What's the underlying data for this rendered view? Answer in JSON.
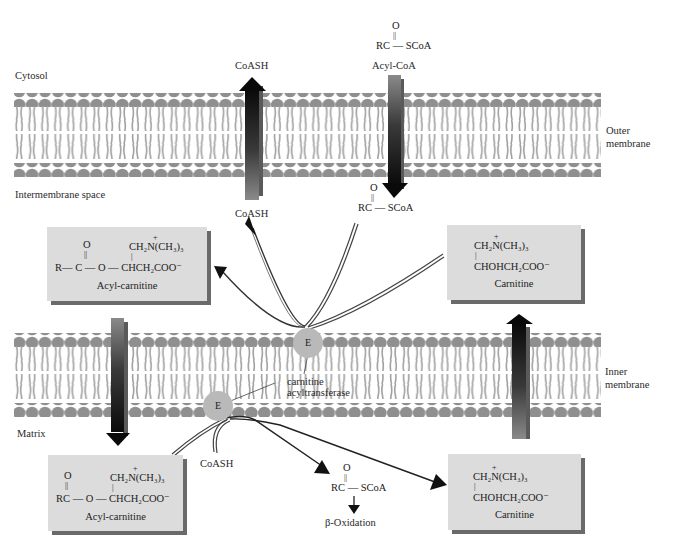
{
  "regions": {
    "cytosol": "Cytosol",
    "intermembrane_space": "Intermembrane space",
    "matrix": "Matrix",
    "outer_membrane": [
      "Outer",
      "membrane"
    ],
    "inner_membrane": [
      "Inner",
      "membrane"
    ]
  },
  "outer_transport": {
    "coash_top": "CoASH",
    "coash_bottom": "CoASH",
    "acylcoa_top": {
      "o": "O",
      "bond": "||",
      "formula": "RC — SCoA",
      "name": "Acyl-CoA"
    },
    "acylcoa_bottom": {
      "o": "O",
      "bond": "||",
      "formula": "RC — SCoA"
    }
  },
  "boxes": {
    "acyl_carnitine_top": {
      "o": "O",
      "bond": "||",
      "line1_charge": "+",
      "line1": "CH₂N(CH₃)₃",
      "line2": "R— C — O — CHCH₂COO⁻",
      "caption": "Acyl-carnitine"
    },
    "carnitine_top": {
      "line1_charge": "+",
      "line1": "CH₂N(CH₃)₃",
      "line2": "CHOHCH₂COO⁻",
      "caption": "Carnitine"
    },
    "acyl_carnitine_bottom": {
      "o": "O",
      "bond": "||",
      "line1_charge": "+",
      "line1": "CH₂N(CH₃)₃",
      "line2": "RC — O — CHCH₂COO⁻",
      "caption": "Acyl-carnitine"
    },
    "carnitine_bottom": {
      "line1_charge": "+",
      "line1": "CH₂N(CH₃)₃",
      "line2": "CHOHCH₂COO⁻",
      "caption": "Carnitine"
    }
  },
  "enzyme": {
    "symbol": "E",
    "name_line1": "carnitine",
    "name_line2": "acyltransferase"
  },
  "matrix_products": {
    "coash": "CoASH",
    "acylcoa": {
      "o": "O",
      "bond": "||",
      "formula": "RC — SCoA"
    },
    "beta_oxidation": "β-Oxidation"
  },
  "colors": {
    "lipid_head": "#8f8f8f",
    "lipid_tail": "#9e9e9e",
    "box_fill": "#dcdcdc",
    "box_shadow": "#6a6a6a",
    "enzyme": "#b9b9b9",
    "arrow_dark": "#111111",
    "arrow_light": "#8a8a8a"
  }
}
